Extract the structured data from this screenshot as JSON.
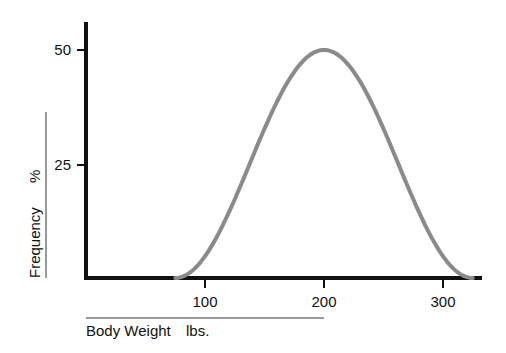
{
  "chart_data": {
    "type": "line",
    "title": "",
    "xlabel": "Body Weight",
    "xunit": "lbs.",
    "ylabel": "Frequency",
    "yunit": "%",
    "xlim": [
      0,
      330
    ],
    "ylim": [
      0,
      55
    ],
    "xticks": [
      "100",
      "200",
      "300"
    ],
    "yticks": [
      "25",
      "50"
    ],
    "grid": false,
    "legend": null,
    "series": [
      {
        "name": "Body weight distribution",
        "color": "#888888",
        "x": [
          75,
          87.5,
          100,
          112.5,
          125,
          137.5,
          150,
          162.5,
          175,
          187.5,
          200,
          212.5,
          225,
          237.5,
          250,
          262.5,
          275,
          287.5,
          300,
          312.5,
          325
        ],
        "y": [
          0,
          0.6,
          2.4,
          5.2,
          9.0,
          13.7,
          19.1,
          24.9,
          30.9,
          36.6,
          41.9,
          45.2,
          47.6,
          49.4,
          50,
          49.4,
          47.6,
          45.2,
          41.9,
          36.6,
          0
        ]
      }
    ],
    "peak": {
      "x": 200,
      "y": 50
    }
  }
}
